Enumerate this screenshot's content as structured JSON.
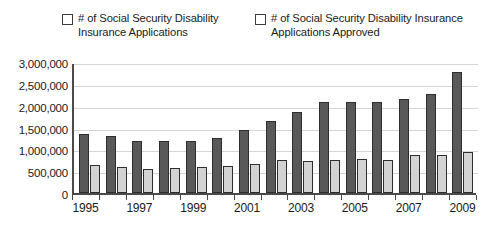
{
  "chart_data": {
    "type": "bar",
    "title": "",
    "xlabel": "",
    "ylabel": "",
    "ylim": [
      0,
      3000000
    ],
    "grid": true,
    "legend_position": "top",
    "categories": [
      "1995",
      "1996",
      "1997",
      "1998",
      "1999",
      "2000",
      "2001",
      "2002",
      "2003",
      "2004",
      "2005",
      "2006",
      "2007",
      "2008",
      "2009"
    ],
    "visible_tick_labels": [
      "1995",
      "1997",
      "1999",
      "2001",
      "2003",
      "2005",
      "2007",
      "2009"
    ],
    "y_tick_labels": [
      "3,000,000",
      "2,500,000",
      "2,000,000",
      "1,500,000",
      "1,000,000",
      "500,000",
      "0"
    ],
    "y_tick_values": [
      3000000,
      2500000,
      2000000,
      1500000,
      1000000,
      500000,
      0
    ],
    "series": [
      {
        "name": "# of Social Security Disability Insurance Applications",
        "color": "#595959",
        "values": [
          1350000,
          1300000,
          1200000,
          1180000,
          1200000,
          1270000,
          1450000,
          1650000,
          1850000,
          2080000,
          2080000,
          2090000,
          2150000,
          2270000,
          2780000
        ]
      },
      {
        "name": "# of Social Security Disability Insurance Applications Approved",
        "color": "#d2d2d2",
        "values": [
          640000,
          600000,
          550000,
          570000,
          600000,
          620000,
          660000,
          760000,
          740000,
          760000,
          770000,
          750000,
          870000,
          870000,
          940000
        ]
      }
    ]
  }
}
